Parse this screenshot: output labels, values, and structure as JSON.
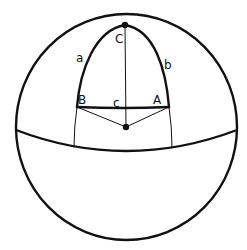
{
  "diagram": {
    "colors": {
      "stroke": "#111111",
      "background": "#ffffff"
    },
    "vertices": {
      "A": {
        "label": "A"
      },
      "B": {
        "label": "B"
      },
      "C": {
        "label": "C"
      }
    },
    "sides": {
      "a": {
        "label": "a"
      },
      "b": {
        "label": "b"
      },
      "c": {
        "label": "c"
      }
    }
  }
}
